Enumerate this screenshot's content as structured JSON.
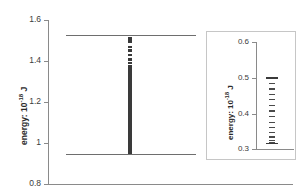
{
  "chart_data": {
    "type": "scatter",
    "title": "",
    "xlabel": "",
    "ylabel": "energy: 10^-18 J",
    "ylabel_prefix": "energy:  10",
    "ylabel_exponent": "-18",
    "ylabel_suffix": " J",
    "ylim": [
      0.8,
      1.6
    ],
    "yticks": [
      0.8,
      1.0,
      1.2,
      1.4,
      1.6
    ],
    "ytick_labels": [
      "0.8",
      "1",
      "1.2",
      "1.4",
      "1.6"
    ],
    "grid": false,
    "legend": "none",
    "reference_lines": [
      {
        "name": "upper-bound",
        "value": 1.505
      },
      {
        "name": "lower-bound",
        "value": 0.95
      }
    ],
    "series": [
      {
        "name": "energy-levels",
        "marker": "square",
        "x_category": "single-column",
        "values": [
          1.51,
          1.497,
          1.47,
          1.452,
          1.43,
          1.408,
          1.392,
          1.374,
          1.362,
          1.352,
          1.344,
          1.336,
          1.328,
          1.32,
          1.312,
          1.305,
          1.298,
          1.291,
          1.284,
          1.277,
          1.27,
          1.263,
          1.257,
          1.251,
          1.245,
          1.239,
          1.233,
          1.227,
          1.221,
          1.215,
          1.21,
          1.204,
          1.199,
          1.193,
          1.188,
          1.183,
          1.178,
          1.172,
          1.167,
          1.162,
          1.157,
          1.152,
          1.147,
          1.142,
          1.137,
          1.133,
          1.128,
          1.123,
          1.118,
          1.114,
          1.109,
          1.104,
          1.1,
          1.095,
          1.091,
          1.086,
          1.082,
          1.077,
          1.073,
          1.069,
          1.064,
          1.06,
          1.056,
          1.052,
          1.047,
          1.043,
          1.039,
          1.035,
          1.031,
          1.027,
          1.023,
          1.019,
          1.015,
          1.011,
          1.007,
          1.003,
          0.999,
          0.996,
          0.992,
          0.988,
          0.984,
          0.981,
          0.977,
          0.973,
          0.97,
          0.966,
          0.963,
          0.959,
          0.956,
          0.952
        ]
      }
    ],
    "inset": {
      "type": "scatter",
      "ylabel": "energy: 10^-18 J",
      "ylabel_prefix": "energy:  10",
      "ylabel_exponent": "-18",
      "ylabel_suffix": " J",
      "ylim": [
        0.3,
        0.6
      ],
      "yticks": [
        0.3,
        0.4,
        0.5,
        0.6
      ],
      "ytick_labels": [
        "0.3",
        "0.4",
        "0.5",
        "0.6"
      ],
      "grid": false,
      "reference_lines": [
        {
          "name": "inset-upper-bound",
          "value": 0.502
        },
        {
          "name": "inset-lower-bound",
          "value": 0.318
        }
      ],
      "series": [
        {
          "name": "inset-energy-levels",
          "marker": "dash",
          "values": [
            0.5,
            0.486,
            0.47,
            0.455,
            0.44,
            0.424,
            0.408,
            0.393,
            0.377,
            0.362,
            0.348,
            0.336,
            0.326,
            0.319
          ]
        }
      ]
    }
  }
}
